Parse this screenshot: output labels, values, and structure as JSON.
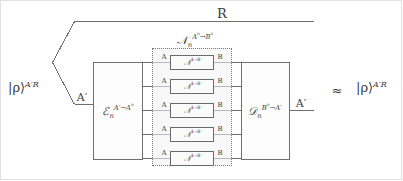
{
  "figure": {
    "type": "quantum-channel-coding-diagram",
    "background_color": "#ffffff",
    "line_color": "#6f6f6f",
    "input_state": {
      "label_ket": "|ρ⟩",
      "label_sup": "A′R",
      "name": "input-state-rho"
    },
    "reference_wire": {
      "label": "R"
    },
    "encoder": {
      "symbol": "ℰ",
      "sub": "n",
      "sup_in": "A′",
      "arrow": "→",
      "sup_out": "A",
      "sup_out_exp": "n"
    },
    "channel_block": {
      "symbol": "𝒩",
      "sub": "n",
      "sup_in": "A",
      "sup_in_exp": "n",
      "arrow": "→",
      "sup_out": "B",
      "sup_out_exp": "n",
      "rows": [
        {
          "in_label": "A",
          "op_symbol": "𝒩",
          "op_sup_in": "A",
          "op_arrow": "→",
          "op_sup_out": "B",
          "out_label": "B"
        },
        {
          "in_label": "A",
          "op_symbol": "𝒩",
          "op_sup_in": "A",
          "op_arrow": "→",
          "op_sup_out": "B",
          "out_label": "B"
        },
        {
          "in_label": "A",
          "op_symbol": "𝒩",
          "op_sup_in": "A",
          "op_arrow": "→",
          "op_sup_out": "B",
          "out_label": "B"
        },
        {
          "in_label": "A",
          "op_symbol": "𝒩",
          "op_sup_in": "A",
          "op_arrow": "→",
          "op_sup_out": "B",
          "out_label": "B"
        },
        {
          "in_label": "A",
          "op_symbol": "𝒩",
          "op_sup_in": "A",
          "op_arrow": "→",
          "op_sup_out": "B",
          "out_label": "B"
        }
      ]
    },
    "decoder": {
      "symbol": "𝒟",
      "sub": "n",
      "sup_in": "B",
      "sup_in_exp": "n",
      "arrow": "→",
      "sup_out": "A′"
    },
    "output_wire": {
      "label": "A′"
    },
    "encoder_input_wire": {
      "label": "A′"
    },
    "relation": {
      "symbol": "≈",
      "label_ket": "|ρ⟩",
      "label_sup": "A′R"
    }
  }
}
